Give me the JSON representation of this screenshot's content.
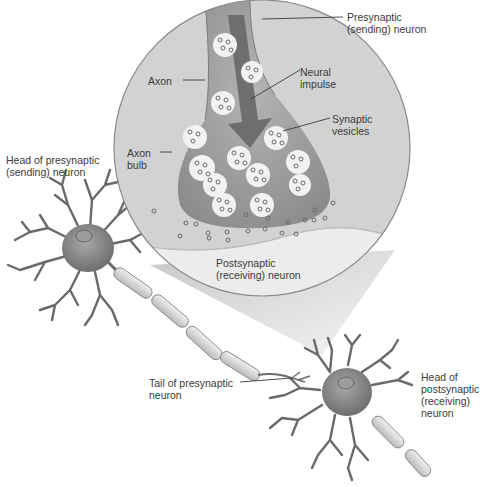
{
  "diagram": {
    "type": "biology-illustration",
    "colors": {
      "background": "#ffffff",
      "magnifier_fill": "#d2d2d2",
      "magnifier_edge": "#8a8a8a",
      "cone_fill": "#bdbdbd",
      "axon_fill": "#a4a4a4",
      "axon_dark": "#8a8a8a",
      "postsynaptic_fill": "#ececec",
      "vesicle_fill": "#f2f2f2",
      "neurotransmitter": "#6a6a6a",
      "neuron_body": "#8c8c8c",
      "myelin": "#dcdcdc",
      "arrow": "#6e6e6e",
      "label_text": "#3a3a3a",
      "leader_line": "#3a3a3a"
    },
    "labels": {
      "presynaptic": "Presynaptic\n(sending) neuron",
      "axon": "Axon",
      "neural_impulse": "Neural\nimpulse",
      "synaptic_vesicles": "Synaptic\nvesicles",
      "axon_bulb": "Axon\nbulb",
      "head_presynaptic": "Head of presynaptic\n(sending) neuron",
      "postsynaptic": "Postsynaptic\n(receiving) neuron",
      "tail_presynaptic": "Tail of presynaptic\nneuron",
      "head_postsynaptic": "Head of\npostsynaptic\n(receiving)\nneuron"
    }
  }
}
